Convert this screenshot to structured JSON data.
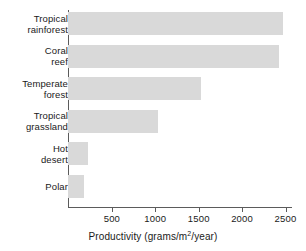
{
  "chart_data": {
    "type": "bar",
    "orientation": "horizontal",
    "title": "",
    "xlabel": "Productivity (grams/m²/year)",
    "ylabel": "",
    "categories": [
      "Tropical rainforest",
      "Coral reef",
      "Temperate forest",
      "Tropical grassland",
      "Hot desert",
      "Polar"
    ],
    "category_lines": [
      [
        "Tropical",
        "rainforest"
      ],
      [
        "Coral",
        "reef"
      ],
      [
        "Temperate",
        "forest"
      ],
      [
        "Tropical",
        "grassland"
      ],
      [
        "Hot",
        "desert"
      ],
      [
        "Polar"
      ]
    ],
    "values": [
      2480,
      2430,
      1530,
      1040,
      230,
      190
    ],
    "xlim": [
      0,
      2600
    ],
    "xticks": [
      500,
      1000,
      1500,
      2000,
      2500
    ],
    "xtick_labels": [
      "500",
      "1000",
      "1500",
      "2000",
      "2500"
    ],
    "grid": false,
    "legend": false,
    "bar_color": "#d9d9d9",
    "axis_color": "#5b5b5b",
    "text_color": "#1a1a1a"
  }
}
